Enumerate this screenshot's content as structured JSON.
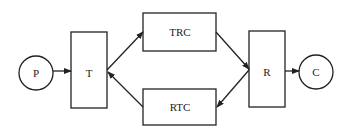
{
  "diagram": {
    "nodes": [
      {
        "id": "P",
        "label": "P",
        "shape": "circle"
      },
      {
        "id": "T",
        "label": "T",
        "shape": "rect"
      },
      {
        "id": "TRC",
        "label": "TRC",
        "shape": "rect"
      },
      {
        "id": "RTC",
        "label": "RTC",
        "shape": "rect"
      },
      {
        "id": "R",
        "label": "R",
        "shape": "rect"
      },
      {
        "id": "C",
        "label": "C",
        "shape": "circle"
      }
    ],
    "edges": [
      {
        "from": "P",
        "to": "T"
      },
      {
        "from": "T",
        "to": "TRC"
      },
      {
        "from": "RTC",
        "to": "T"
      },
      {
        "from": "TRC",
        "to": "R"
      },
      {
        "from": "R",
        "to": "RTC"
      },
      {
        "from": "R",
        "to": "C"
      }
    ],
    "colors": {
      "stroke": "#222222",
      "background": "#ffffff"
    }
  }
}
